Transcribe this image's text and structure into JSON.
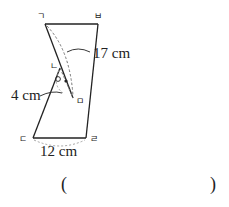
{
  "figure": {
    "vertex_labels": {
      "top_left": "ㄱ",
      "top_right": "ㅂ",
      "fold_upper": "ㄴ",
      "fold_lower": "ㅁ",
      "bottom_left": "ㄷ",
      "bottom_right": "ㄹ"
    },
    "measurements": {
      "diagonal": "17 cm",
      "side": "4 cm",
      "bottom": "12 cm"
    },
    "angle_marks": {
      "circle": "○",
      "dot": "●"
    },
    "colors": {
      "line": "#222222",
      "dashed": "#777777"
    }
  },
  "answer": {
    "open_paren": "(",
    "close_paren": ")",
    "value": ""
  }
}
